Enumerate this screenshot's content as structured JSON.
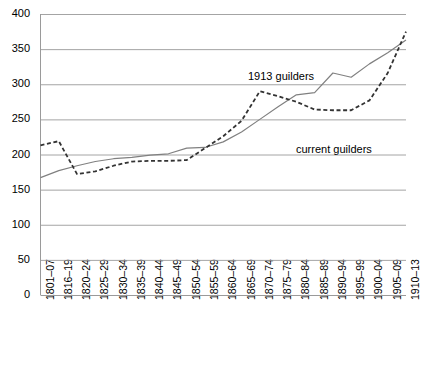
{
  "chart_data": {
    "type": "line",
    "title": "",
    "subtitle": "",
    "xlabel": "",
    "ylabel": "",
    "ylim": [
      0,
      400
    ],
    "ytick_step": 50,
    "grid": true,
    "legend_position": "inline-annotation",
    "categories": [
      "1801–07",
      "1816–19",
      "1820–24",
      "1825–29",
      "1830–34",
      "1835–39",
      "1840–44",
      "1845–49",
      "1850–54",
      "1855–59",
      "1860–64",
      "1865–69",
      "1870–74",
      "1875–79",
      "1880–84",
      "1885–89",
      "1890–94",
      "1895–99",
      "1900–04",
      "1905–09",
      "1910–13"
    ],
    "yticks": [
      "0",
      "50",
      "100",
      "150",
      "200",
      "250",
      "300",
      "350",
      "400"
    ],
    "ytick_values": [
      0,
      50,
      100,
      150,
      200,
      250,
      300,
      350,
      400
    ],
    "series": [
      {
        "name": "1913 guilders",
        "style": "solid",
        "color": "#808080",
        "values": [
          167,
          177,
          184,
          190,
          194,
          196,
          199,
          201,
          209,
          210,
          218,
          232,
          250,
          268,
          285,
          288,
          316,
          310,
          329,
          345,
          363
        ]
      },
      {
        "name": "current guilders",
        "style": "dashed",
        "color": "#333333",
        "values": [
          213,
          219,
          172,
          176,
          184,
          190,
          191,
          191,
          192,
          209,
          226,
          248,
          290,
          283,
          275,
          264,
          263,
          263,
          277,
          316,
          375
        ]
      }
    ],
    "annotations": [
      {
        "text": "1913 guilders",
        "x_px": 248,
        "y_px": 70
      },
      {
        "text": "current guilders",
        "x_px": 296,
        "y_px": 143
      }
    ]
  },
  "axes": {
    "x_axis_name": "period-axis",
    "y_axis_name": "index-axis"
  }
}
